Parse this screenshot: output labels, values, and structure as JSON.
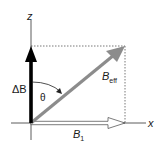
{
  "diagram": {
    "axes": {
      "z_label": "z",
      "x_label": "x"
    },
    "vectors": {
      "delta_b": {
        "label": "ΔB",
        "color": "#000000"
      },
      "b_eff": {
        "label_main": "B",
        "label_sub": "eff",
        "color": "#8c8c8c"
      },
      "b1": {
        "label_main": "B",
        "label_sub": "1",
        "color": "#ffffff"
      }
    },
    "angle": {
      "label": "θ"
    }
  }
}
